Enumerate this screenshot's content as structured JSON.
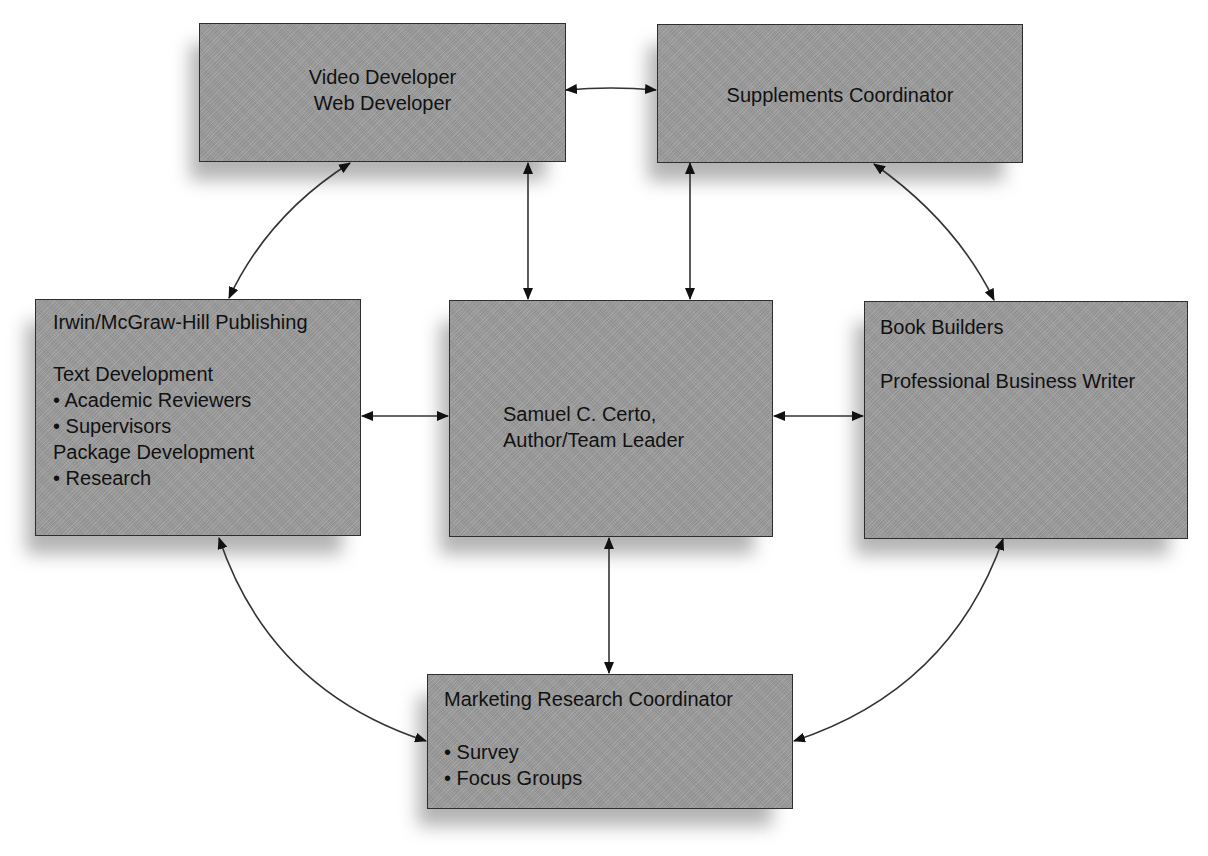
{
  "diagram": {
    "type": "team-relationship-diagram",
    "colors": {
      "box_fill": "#9e9e9e",
      "box_border": "#2e2e2e",
      "shadow": "#9a9a9a",
      "connector": "#333333",
      "background": "#ffffff"
    },
    "nodes": {
      "video": {
        "lines": [
          "Video Developer",
          "Web Developer"
        ]
      },
      "supplements": {
        "lines": [
          "Supplements Coordinator"
        ]
      },
      "publisher": {
        "title": "Irwin/McGraw-Hill Publishing",
        "lines": [
          "Text Development",
          "• Academic Reviewers",
          "• Supervisors",
          "Package Development",
          "• Research"
        ]
      },
      "author": {
        "lines": [
          "Samuel C. Certo,",
          "Author/Team Leader"
        ]
      },
      "bookbuilders": {
        "title": "Book Builders",
        "lines": [
          "Professional Business Writer"
        ]
      },
      "marketing": {
        "title": "Marketing Research Coordinator",
        "lines": [
          "• Survey",
          "• Focus Groups"
        ]
      }
    },
    "edges": [
      {
        "from": "video",
        "to": "supplements",
        "style": "straight",
        "bidirectional": true
      },
      {
        "from": "video",
        "to": "publisher",
        "style": "curved",
        "bidirectional": true
      },
      {
        "from": "video",
        "to": "author",
        "style": "straight",
        "bidirectional": true
      },
      {
        "from": "supplements",
        "to": "author",
        "style": "straight",
        "bidirectional": true
      },
      {
        "from": "supplements",
        "to": "bookbuilders",
        "style": "curved",
        "bidirectional": true
      },
      {
        "from": "publisher",
        "to": "author",
        "style": "straight",
        "bidirectional": true
      },
      {
        "from": "author",
        "to": "bookbuilders",
        "style": "straight",
        "bidirectional": true
      },
      {
        "from": "author",
        "to": "marketing",
        "style": "straight",
        "bidirectional": true
      },
      {
        "from": "publisher",
        "to": "marketing",
        "style": "curved",
        "bidirectional": true
      },
      {
        "from": "bookbuilders",
        "to": "marketing",
        "style": "curved",
        "bidirectional": true
      }
    ]
  }
}
